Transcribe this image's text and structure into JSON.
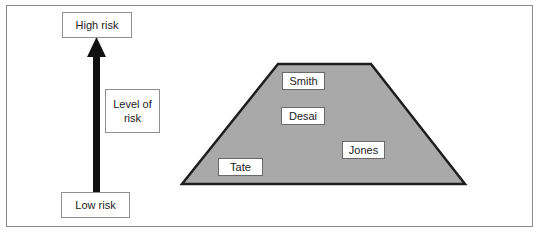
{
  "diagram": {
    "scale": {
      "top_label": "High risk",
      "bottom_label": "Low risk",
      "axis_label": "Level of risk"
    },
    "trapezoid": {
      "fill_color": "#a9a9a9",
      "stroke_color": "#1e1e1e"
    },
    "people": [
      {
        "name": "Smith"
      },
      {
        "name": "Desai"
      },
      {
        "name": "Jones"
      },
      {
        "name": "Tate"
      }
    ]
  }
}
